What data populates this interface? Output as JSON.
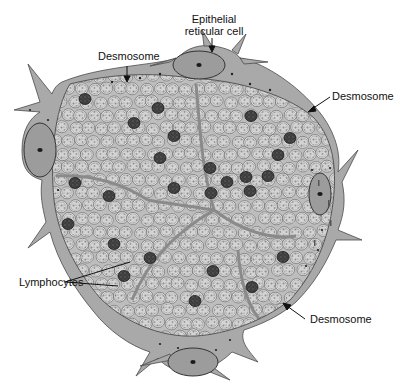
{
  "figure": {
    "type": "histology-illustration",
    "colors": {
      "background": "#ffffff",
      "cytoplasm": "#a9a9a9",
      "cytoplasm_edge": "#4a4a4a",
      "lymphocyte_fill": "#d2d2d2",
      "lymphocyte_texture": "#8a8a8a",
      "dark_lymphocyte": "#3a3a3a",
      "nucleus": "#9a9a9a",
      "nucleolus": "#1a1a1a",
      "label_text": "#111111"
    }
  },
  "labels": {
    "epithelial_reticular_cell": {
      "line1": "Epithelial",
      "line2": "reticular cell"
    },
    "desmosome_top": "Desmosome",
    "desmosome_right": "Desmosome",
    "desmosome_bottom": "Desmosome",
    "lymphocytes": "Lymphocytes"
  },
  "reticular_cells": [
    {
      "name": "top",
      "cx": 199,
      "cy": 65,
      "rx": 26,
      "ry": 14
    },
    {
      "name": "left",
      "cx": 40,
      "cy": 150,
      "rx": 16,
      "ry": 27
    },
    {
      "name": "right",
      "cx": 320,
      "cy": 194,
      "rx": 11,
      "ry": 21
    },
    {
      "name": "bottom",
      "cx": 193,
      "cy": 362,
      "rx": 25,
      "ry": 14
    }
  ],
  "dark_lymphocytes": [
    [
      85,
      99
    ],
    [
      158,
      108
    ],
    [
      134,
      123
    ],
    [
      174,
      136
    ],
    [
      160,
      158
    ],
    [
      210,
      168
    ],
    [
      174,
      188
    ],
    [
      251,
      116
    ],
    [
      290,
      138
    ],
    [
      278,
      155
    ],
    [
      246,
      177
    ],
    [
      211,
      193
    ],
    [
      227,
      182
    ],
    [
      268,
      176
    ],
    [
      250,
      191
    ],
    [
      75,
      183
    ],
    [
      109,
      196
    ],
    [
      68,
      224
    ],
    [
      114,
      244
    ],
    [
      150,
      258
    ],
    [
      124,
      276
    ],
    [
      213,
      271
    ],
    [
      283,
      257
    ],
    [
      195,
      301
    ],
    [
      252,
      287
    ]
  ]
}
